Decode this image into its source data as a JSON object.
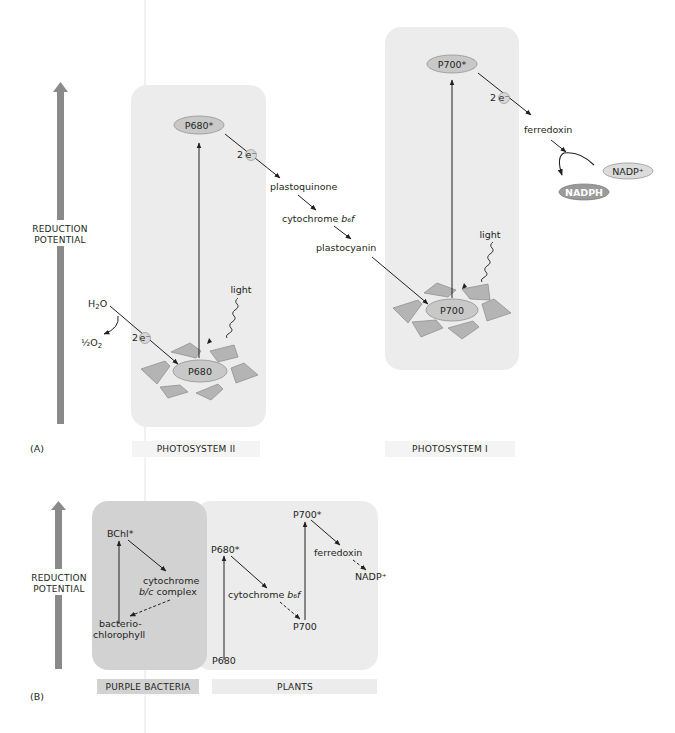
{
  "panel_a": {
    "panel_label": "(A)",
    "axis_label_line1": "REDUCTION",
    "axis_label_line2": "POTENTIAL",
    "photosystem_ii": {
      "caption": "PHOTOSYSTEM II",
      "excited": "P680*",
      "ground": "P680",
      "light": "light",
      "electron_count": "2",
      "electron_symbol": "e⁻",
      "water": "H₂O",
      "oxygen": "½O₂"
    },
    "chain": {
      "item1": "plastoquinone",
      "item2_prefix": "cytochrome ",
      "item2_italic": "b₆f",
      "item3": "plastocyanin"
    },
    "photosystem_i": {
      "caption": "PHOTOSYSTEM I",
      "excited": "P700*",
      "ground": "P700",
      "light": "light",
      "electron_count": "2",
      "electron_symbol": "e⁻",
      "ferredoxin": "ferredoxin",
      "nadp": "NADP⁺",
      "nadph": "NADPH"
    }
  },
  "panel_b": {
    "panel_label": "(B)",
    "axis_label_line1": "REDUCTION",
    "axis_label_line2": "POTENTIAL",
    "purple_bacteria": {
      "caption": "PURPLE BACTERIA",
      "excited": "BChl*",
      "cyt_line1": "cytochrome",
      "cyt_line2_italic": "b/c",
      "cyt_line2_rest": " complex",
      "ground_line1": "bacterio-",
      "ground_line2": "chlorophyll"
    },
    "plants": {
      "caption": "PLANTS",
      "p680_excited": "P680*",
      "p680": "P680",
      "cyt_prefix": "cytochrome ",
      "cyt_italic": "b₆f",
      "p700_excited": "P700*",
      "p700": "P700",
      "ferredoxin": "ferredoxin",
      "nadp": "NADP⁺"
    }
  },
  "colors": {
    "axis_arrow": "#8a8a8a",
    "panel_bg": "#ececec",
    "purple_bg": "#d2d2d2",
    "oval_fill": "#c8c8c8",
    "antenna_fill": "#b4b4b4",
    "nadph_fill": "#9a9a9a",
    "text": "#231f20"
  }
}
